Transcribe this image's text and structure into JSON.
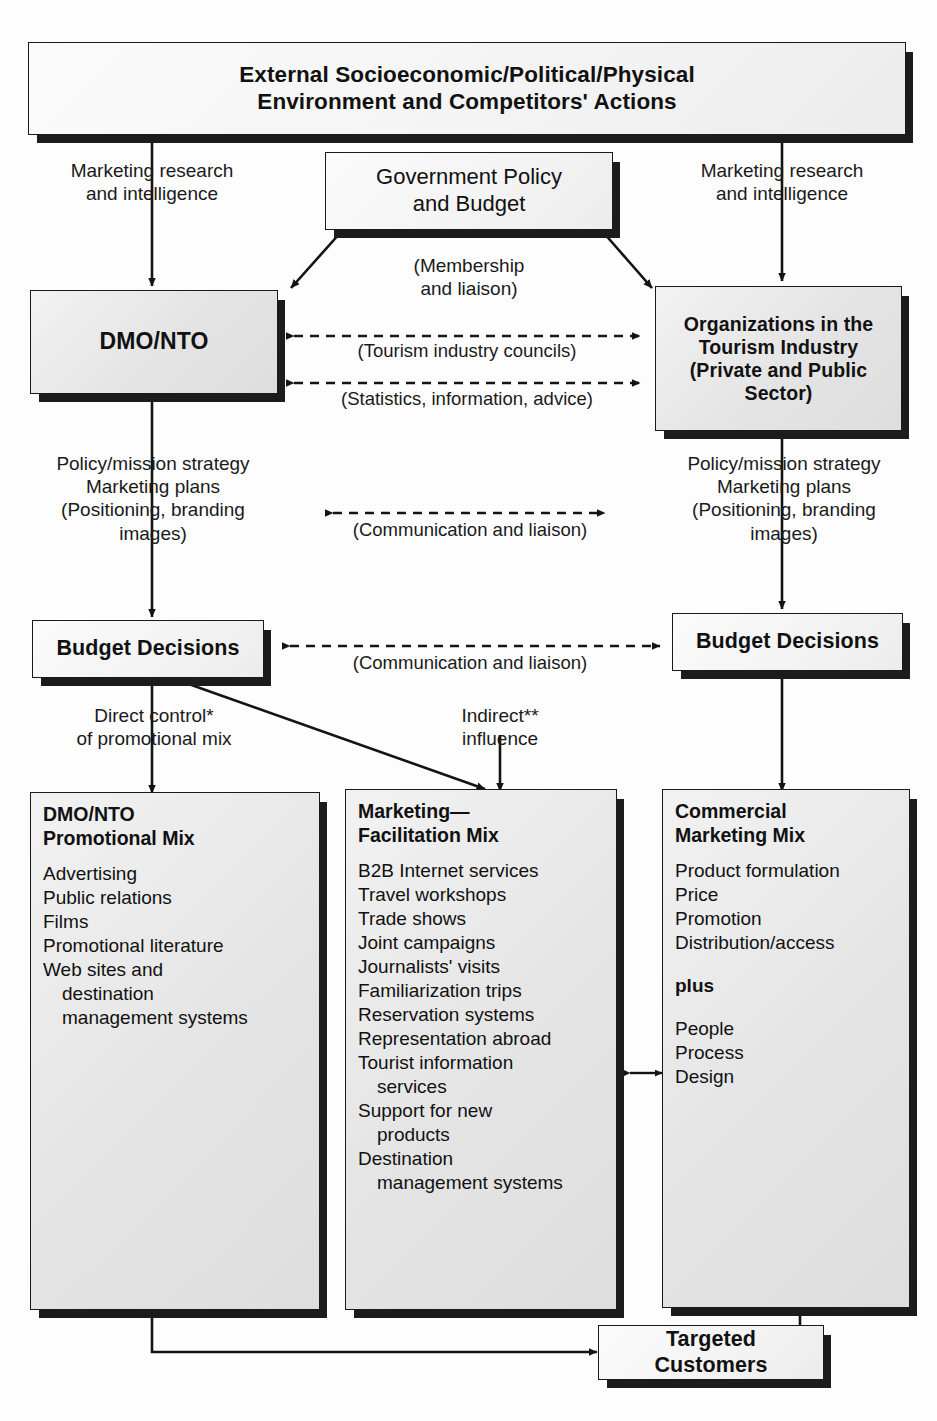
{
  "diagram": {
    "boxes": {
      "external": {
        "line1": "External Socioeconomic/Political/Physical",
        "line2": "Environment and Competitors' Actions"
      },
      "government": {
        "line1": "Government Policy",
        "line2": "and Budget"
      },
      "dmo_nto": {
        "label": "DMO/NTO"
      },
      "organizations": {
        "line1": "Organizations in the",
        "line2": "Tourism Industry",
        "line3": "(Private and Public",
        "line4": "Sector)"
      },
      "budget_left": {
        "label": "Budget Decisions"
      },
      "budget_right": {
        "label": "Budget Decisions"
      },
      "targeted_customers": {
        "label": "Targeted Customers"
      },
      "promotional_mix": {
        "head_line1": "DMO/NTO",
        "head_line2": "Promotional Mix",
        "items": [
          {
            "text": "Advertising",
            "indent": false
          },
          {
            "text": "Public relations",
            "indent": false
          },
          {
            "text": "Films",
            "indent": false
          },
          {
            "text": "Promotional literature",
            "indent": false
          },
          {
            "text": "Web sites and",
            "indent": false
          },
          {
            "text": "destination",
            "indent": true
          },
          {
            "text": "management systems",
            "indent": true
          }
        ]
      },
      "facilitation_mix": {
        "head_line1": "Marketing—",
        "head_line2": "Facilitation Mix",
        "items": [
          {
            "text": "B2B Internet services",
            "indent": false
          },
          {
            "text": "Travel workshops",
            "indent": false
          },
          {
            "text": "Trade shows",
            "indent": false
          },
          {
            "text": "Joint campaigns",
            "indent": false
          },
          {
            "text": "Journalists' visits",
            "indent": false
          },
          {
            "text": "Familiarization trips",
            "indent": false
          },
          {
            "text": "Reservation systems",
            "indent": false
          },
          {
            "text": "Representation abroad",
            "indent": false
          },
          {
            "text": "Tourist information",
            "indent": false
          },
          {
            "text": "services",
            "indent": true
          },
          {
            "text": "Support for new",
            "indent": false
          },
          {
            "text": "products",
            "indent": true
          },
          {
            "text": "Destination",
            "indent": false
          },
          {
            "text": "management systems",
            "indent": true
          }
        ]
      },
      "commercial_mix": {
        "head_line1": "Commercial",
        "head_line2": "Marketing Mix",
        "items": [
          {
            "text": "Product formulation",
            "indent": false,
            "bold": false,
            "gap": false
          },
          {
            "text": "Price",
            "indent": false,
            "bold": false,
            "gap": false
          },
          {
            "text": "Promotion",
            "indent": false,
            "bold": false,
            "gap": false
          },
          {
            "text": "Distribution/access",
            "indent": false,
            "bold": false,
            "gap": false
          },
          {
            "text": "plus",
            "indent": false,
            "bold": true,
            "gap": true
          },
          {
            "text": "People",
            "indent": false,
            "bold": false,
            "gap": true
          },
          {
            "text": "Process",
            "indent": false,
            "bold": false,
            "gap": false
          },
          {
            "text": "Design",
            "indent": false,
            "bold": false,
            "gap": false
          }
        ]
      }
    },
    "edge_labels": {
      "market_research_left": "Marketing research\nand intelligence",
      "market_research_right": "Marketing research\nand intelligence",
      "membership": "(Membership\nand liaison)",
      "tourism_councils": "(Tourism industry councils)",
      "statistics": "(Statistics, information, advice)",
      "policy_left": "Policy/mission strategy\nMarketing plans\n(Positioning, branding\nimages)",
      "policy_right": "Policy/mission strategy\nMarketing plans\n(Positioning, branding\nimages)",
      "communication_upper": "(Communication and liaison)",
      "communication_lower": "(Communication and liaison)",
      "direct_control": "Direct control*\nof promotional mix",
      "indirect_influence": "Indirect**\ninfluence"
    },
    "colors": {
      "ink": "#1a1a1a",
      "box_fill": "#e8e8e8",
      "shadow": "#1c1c1c",
      "page": "#ffffff"
    }
  }
}
